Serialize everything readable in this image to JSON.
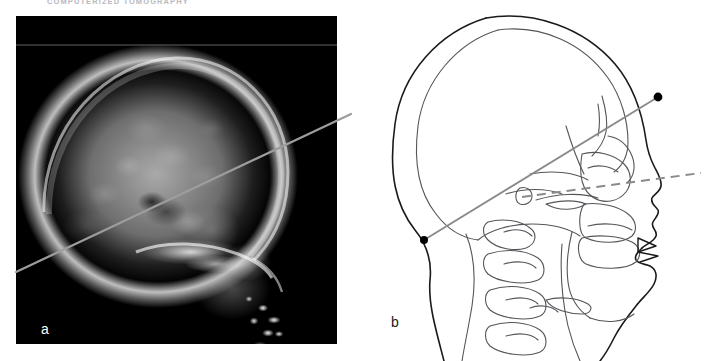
{
  "figure": {
    "running_header": "COMPUTERIZED TOMOGRAPHY",
    "caption_note": "",
    "background_color": "#ffffff"
  },
  "panel_a": {
    "label": "a",
    "kind": "lateral skull radiograph",
    "label_color": "#ffffff",
    "film_color": "#000000",
    "frame": {
      "x": 16,
      "y": 16,
      "width": 321,
      "height": 328
    },
    "overlay_line": {
      "name": "scan-plane-line",
      "style": "solid",
      "color": "#9a9a9a",
      "width_px": 2,
      "from": {
        "x": 16,
        "y": 272
      },
      "to": {
        "x": 351,
        "y": 114
      }
    },
    "features": [
      "cranial vault",
      "skull base",
      "facial bones",
      "dental amalgam fillings"
    ]
  },
  "panel_b": {
    "label": "b",
    "kind": "lateral head line diagram",
    "label_color": "#1a1a1a",
    "stroke_color": "#1a1a1a",
    "inner_stroke_color": "#55555a",
    "scan_line": {
      "name": "scan-plane-line",
      "style": "solid",
      "color": "#8a8a8a",
      "width_px": 1.8,
      "from": {
        "x": 424,
        "y": 240
      },
      "to": {
        "x": 658,
        "y": 97
      },
      "endpoint_marker": "filled-dot",
      "endpoint_radius_px": 4,
      "endpoint_color": "#000000"
    },
    "reference_line": {
      "name": "orbitomeatal-reference-line",
      "style": "dashed",
      "color": "#8a8a8a",
      "width_px": 2,
      "dash": "9 6",
      "from": {
        "x": 522,
        "y": 197
      },
      "to": {
        "x": 701,
        "y": 173
      }
    },
    "features": [
      "scalp outline",
      "inner table of skull",
      "frontal sinus",
      "orbit",
      "nasal bones",
      "maxilla",
      "mandible",
      "hard palate",
      "hyoid",
      "cervical vertebrae C1-C4",
      "external auditory meatus"
    ]
  }
}
